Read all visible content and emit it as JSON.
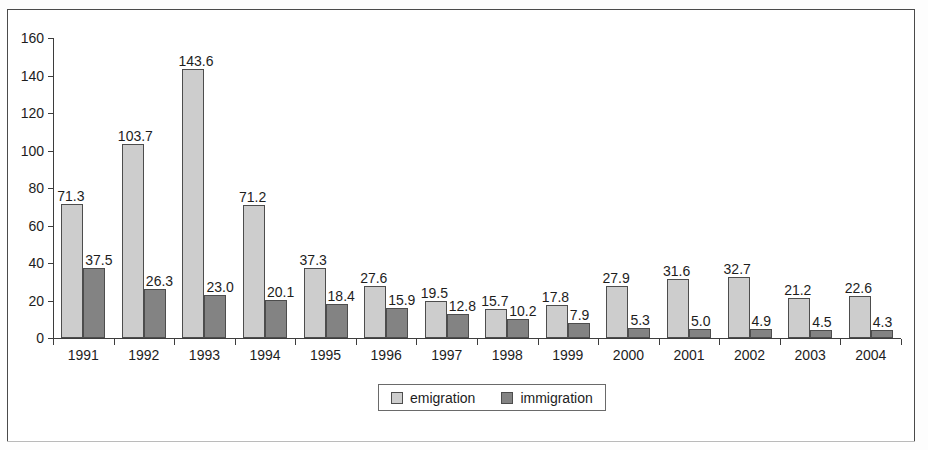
{
  "chart_data": {
    "type": "bar",
    "title": "",
    "subtitle": "",
    "xlabel": "",
    "ylabel": "",
    "ylim": [
      0,
      160
    ],
    "yticks": [
      0,
      20,
      40,
      60,
      80,
      100,
      120,
      140,
      160
    ],
    "grid": false,
    "legend_position": "bottom",
    "categories": [
      "1991",
      "1992",
      "1993",
      "1994",
      "1995",
      "1996",
      "1997",
      "1998",
      "1999",
      "2000",
      "2001",
      "2002",
      "2003",
      "2004"
    ],
    "series": [
      {
        "name": "emigration",
        "color": "#cdcdcd",
        "values": [
          71.3,
          103.7,
          143.6,
          71.2,
          37.3,
          27.6,
          19.5,
          15.7,
          17.8,
          27.9,
          31.6,
          32.7,
          21.2,
          22.6
        ],
        "labels": [
          "71.3",
          "103.7",
          "143.6",
          "71.2",
          "37.3",
          "27.6",
          "19.5",
          "15.7",
          "17.8",
          "27.9",
          "31.6",
          "32.7",
          "21.2",
          "22.6"
        ]
      },
      {
        "name": "immigration",
        "color": "#838383",
        "values": [
          37.5,
          26.3,
          23.0,
          20.1,
          18.4,
          15.9,
          12.8,
          10.2,
          7.9,
          5.3,
          5.0,
          4.9,
          4.5,
          4.3
        ],
        "labels": [
          "37.5",
          "26.3",
          "23.0",
          "20.1",
          "18.4",
          "15.9",
          "12.8",
          "10.2",
          "7.9",
          "5.3",
          "5.0",
          "4.9",
          "4.5",
          "4.3"
        ]
      }
    ]
  },
  "legend": {
    "entries": [
      {
        "label": "emigration",
        "color": "#cdcdcd"
      },
      {
        "label": "immigration",
        "color": "#838383"
      }
    ]
  },
  "axis": {
    "y_tick_labels": [
      "0",
      "20",
      "40",
      "60",
      "80",
      "100",
      "120",
      "140",
      "160"
    ],
    "x_tick_labels": [
      "1991",
      "1992",
      "1993",
      "1994",
      "1995",
      "1996",
      "1997",
      "1998",
      "1999",
      "2000",
      "2001",
      "2002",
      "2003",
      "2004"
    ]
  },
  "colors": {
    "emigration": "#cdcdcd",
    "immigration": "#838383",
    "axis": "#3d3d3d",
    "frame": "#4a4a4a",
    "text": "#1d1d1d"
  }
}
